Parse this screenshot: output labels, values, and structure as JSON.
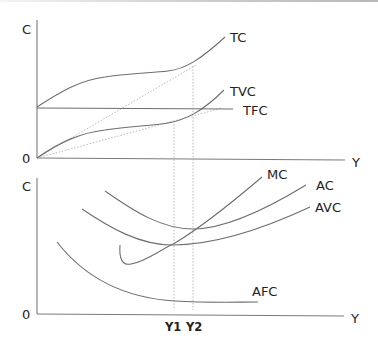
{
  "diagram": {
    "type": "cost-curves",
    "top_panel": {
      "y_axis_label": "C",
      "x_axis_label": "Y",
      "origin_label": "0",
      "curves": [
        {
          "id": "tc",
          "label": "TC"
        },
        {
          "id": "tvc",
          "label": "TVC"
        },
        {
          "id": "tfc",
          "label": "TFC"
        }
      ]
    },
    "bottom_panel": {
      "y_axis_label": "C",
      "x_axis_label": "Y",
      "origin_label": "0",
      "curves": [
        {
          "id": "mc",
          "label": "MC"
        },
        {
          "id": "ac",
          "label": "AC"
        },
        {
          "id": "avc",
          "label": "AVC"
        },
        {
          "id": "afc",
          "label": "AFC"
        }
      ],
      "x_markers": [
        {
          "id": "y1",
          "label": "Y1"
        },
        {
          "id": "y2",
          "label": "Y2"
        }
      ]
    },
    "colors": {
      "curve": "#6e6e6e",
      "axis": "#7a7a7a",
      "guide": "#b5b5b5",
      "text": "#222222"
    }
  }
}
